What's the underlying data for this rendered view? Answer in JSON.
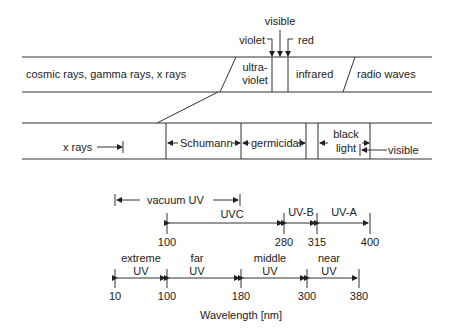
{
  "top_band": {
    "labels": {
      "cosmic": "cosmic rays, gamma rays, x rays",
      "uv_line1": "ultra-",
      "uv_line2": "violet",
      "infrared": "infrared",
      "radio": "radio waves"
    },
    "callouts": {
      "visible": "visible",
      "violet": "violet",
      "red": "red"
    }
  },
  "uv_band": {
    "labels": {
      "xrays": "x rays",
      "schumann": "Schumann",
      "germicidal": "germicidal",
      "black_line1": "black",
      "black_line2": "light",
      "visible": "visible"
    }
  },
  "cie_scale": {
    "vacuum": "vacuum UV",
    "uvc": "UVC",
    "uvb": "UV-B",
    "uva": "UV-A",
    "ticks": [
      "100",
      "280",
      "315",
      "400"
    ]
  },
  "iso_scale": {
    "bands": [
      {
        "line1": "extreme",
        "line2": "UV"
      },
      {
        "line1": "far",
        "line2": "UV"
      },
      {
        "line1": "middle",
        "line2": "UV"
      },
      {
        "line1": "near",
        "line2": "UV"
      }
    ],
    "ticks": [
      "10",
      "100",
      "180",
      "300",
      "380"
    ]
  },
  "axis": {
    "label": "Wavelength [nm]"
  }
}
